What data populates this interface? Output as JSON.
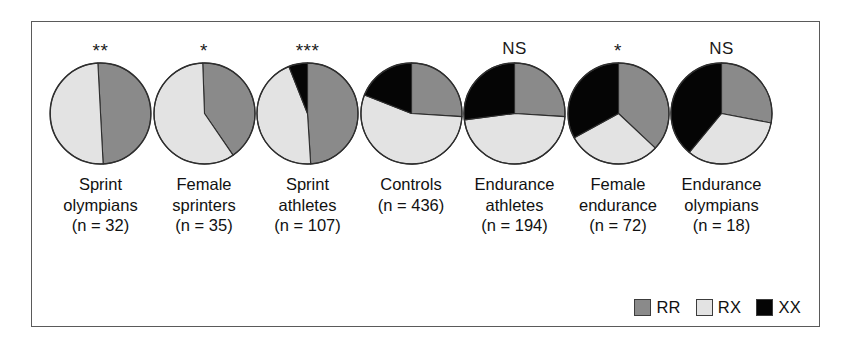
{
  "figure": {
    "colors": {
      "RR": "#8a8a8a",
      "RX": "#e3e3e3",
      "XX": "#050505",
      "outline": "#2e2e2e",
      "frame": "#5a5a5a",
      "background": "#ffffff"
    }
  },
  "legend": {
    "items": [
      {
        "key": "RR",
        "label": "RR",
        "color": "#8a8a8a"
      },
      {
        "key": "RX",
        "label": "RX",
        "color": "#e3e3e3"
      },
      {
        "key": "XX",
        "label": "XX",
        "color": "#050505"
      }
    ]
  },
  "chart_data": {
    "type": "pie",
    "title": "",
    "legend_position": "bottom-right",
    "categories": [
      "RR",
      "RX",
      "XX"
    ],
    "series": [
      {
        "name": "Sprint olympians",
        "label_lines": [
          "Sprint",
          "olympians",
          "(n = 32)"
        ],
        "n": 32,
        "significance": "**",
        "values": [
          50,
          50,
          0
        ],
        "start_angle": -3
      },
      {
        "name": "Female sprinters",
        "label_lines": [
          "Female",
          "sprinters",
          "(n = 35)"
        ],
        "n": 35,
        "significance": "*",
        "values": [
          41,
          59,
          0
        ],
        "start_angle": -2
      },
      {
        "name": "Sprint athletes",
        "label_lines": [
          "Sprint",
          "athletes",
          "(n = 107)"
        ],
        "n": 107,
        "significance": "***",
        "values": [
          49,
          45,
          6
        ],
        "start_angle": 0
      },
      {
        "name": "Controls",
        "label_lines": [
          "Controls",
          "(n = 436)"
        ],
        "n": 436,
        "significance": "",
        "values": [
          26,
          55,
          19
        ],
        "start_angle": 0
      },
      {
        "name": "Endurance athletes",
        "label_lines": [
          "Endurance",
          "athletes",
          "(n = 194)"
        ],
        "n": 194,
        "significance": "NS",
        "values": [
          26,
          47,
          27
        ],
        "start_angle": 0
      },
      {
        "name": "Female endurance",
        "label_lines": [
          "Female",
          "endurance",
          "(n = 72)"
        ],
        "n": 72,
        "significance": "*",
        "values": [
          37,
          30,
          33
        ],
        "start_angle": 0
      },
      {
        "name": "Endurance olympians",
        "label_lines": [
          "Endurance",
          "olympians",
          "(n = 18)"
        ],
        "n": 18,
        "significance": "NS",
        "values": [
          28,
          33,
          39
        ],
        "start_angle": 0
      }
    ]
  }
}
